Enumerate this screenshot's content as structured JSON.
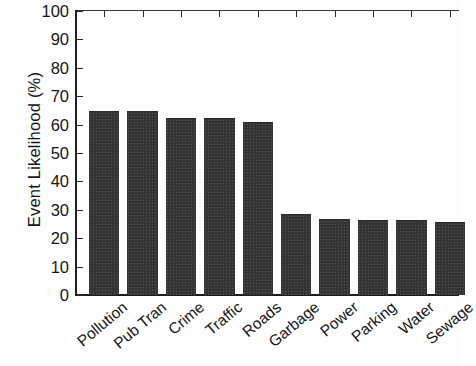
{
  "chart_data": {
    "type": "bar",
    "title": "",
    "xlabel": "",
    "ylabel": "Event Likelihood (%)",
    "categories": [
      "Pollution",
      "Pub Tran",
      "Crime",
      "Traffic",
      "Roads",
      "Garbage",
      "Power",
      "Parking",
      "Water",
      "Sewage"
    ],
    "values": [
      64.5,
      64.3,
      62.0,
      61.9,
      60.5,
      28.3,
      26.5,
      26.2,
      26.2,
      25.5
    ],
    "ylim": [
      0,
      100
    ],
    "ytick_labels": [
      "100",
      "90",
      "80",
      "70",
      "60",
      "50",
      "40",
      "30",
      "20",
      "10",
      "0"
    ],
    "yticks": [
      100,
      90,
      80,
      70,
      60,
      50,
      40,
      30,
      20,
      10,
      0
    ],
    "grid": false,
    "legend": false,
    "bar_color": "#343434",
    "axis_color": "#1e1e1e"
  }
}
